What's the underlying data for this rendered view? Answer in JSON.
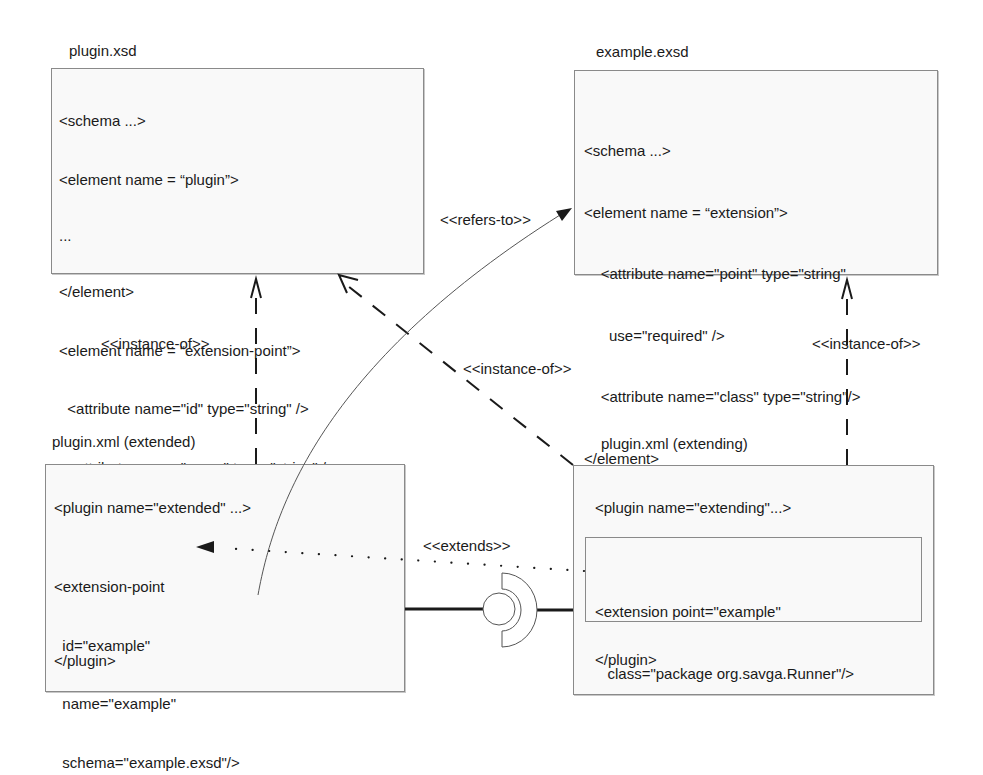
{
  "boxes": {
    "plugin_xsd": {
      "title": "plugin.xsd",
      "lines": [
        "<schema ...>",
        "<element name = “plugin”>",
        "...",
        "</element>",
        "<element name = “extension-point”>",
        "  <attribute name=\"id\" type=\"string\" />",
        "  <attribute name=\"name\" type=\"string\" />",
        "  <attribute name=\"schema\" type=\"string\" />",
        "</element>",
        "</schema>"
      ]
    },
    "example_exsd": {
      "title": "example.exsd",
      "lines": [
        "<schema ...>",
        "<element name = “extension”>",
        "    <attribute name=\"point\" type=\"string\"",
        "      use=\"required\" />",
        "    <attribute name=\"class\" type=\"string\"/>",
        "</element>",
        "</schema>"
      ]
    },
    "plugin_xml_extended": {
      "title": "plugin.xml (extended)",
      "plugin_open": "<plugin name=\"extended\" ...>",
      "ext_point_lines": [
        "<extension-point",
        "  id=\"example\"",
        "  name=\"example\"",
        "  schema=\"example.exsd\"/>"
      ],
      "plugin_close": "</plugin>"
    },
    "plugin_xml_extending": {
      "title": "plugin.xml (extending)",
      "plugin_open": "<plugin name=\"extending\"...>",
      "extension_lines": [
        "<extension point=\"example\"",
        "   class=\"package org.savga.Runner\"/>"
      ],
      "plugin_close": "</plugin>"
    }
  },
  "relations": {
    "instance_of_left": "<<instance-of>>",
    "instance_of_diagonal": "<<instance-of>>",
    "instance_of_right": "<<instance-of>>",
    "refers_to": "<<refers-to>>",
    "extends": "<<extends>>"
  },
  "colors": {
    "line": "#1a1a1a",
    "box_border": "#8a8a8a",
    "box_fill": "#f9f9f9",
    "thin_curve": "#555555"
  }
}
